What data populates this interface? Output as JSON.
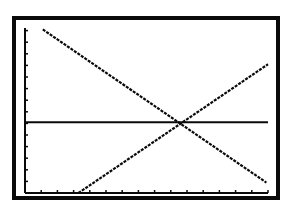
{
  "screen": {
    "type": "graphing-calculator-screen",
    "colors": {
      "background": "#ffffff",
      "ink": "#0a0a0a"
    }
  },
  "chart_data": {
    "type": "line",
    "title": "",
    "xlabel": "",
    "ylabel": "",
    "grid": false,
    "legend": "none",
    "xlim": [
      0,
      15
    ],
    "ylim": [
      0,
      14.2
    ],
    "x_tick_step": 1,
    "y_tick_step": 1,
    "axes": {
      "x_axis_at_y": 0,
      "y_axis_at_x": 0
    },
    "series": [
      {
        "name": "decreasing-line",
        "points": [
          [
            1.1,
            14.1
          ],
          [
            14.9,
            0.9
          ]
        ]
      },
      {
        "name": "increasing-line",
        "points": [
          [
            3.3,
            0
          ],
          [
            15.0,
            11.1
          ]
        ]
      },
      {
        "name": "horizontal-line",
        "points": [
          [
            0,
            6.1
          ],
          [
            15.0,
            6.1
          ]
        ]
      }
    ],
    "annotations": [
      {
        "type": "intersection",
        "x": 9.6,
        "y": 6.1,
        "note": "all three lines meet"
      }
    ]
  },
  "plot_pixels": {
    "origin": [
      25,
      193
    ],
    "px_per_x": 16.2,
    "px_per_y": 11.6,
    "x_axis_end": 268,
    "y_axis_top": 28
  }
}
